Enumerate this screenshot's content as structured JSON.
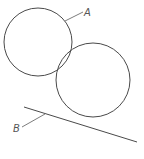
{
  "diagram": {
    "labels": {
      "circle_a": "A",
      "line_b": "B"
    },
    "elements": [
      {
        "id": "circle-a",
        "type": "circle",
        "label": "A"
      },
      {
        "id": "circle-b",
        "type": "circle",
        "label": ""
      },
      {
        "id": "tangent-line",
        "type": "line",
        "label": "B"
      }
    ]
  }
}
